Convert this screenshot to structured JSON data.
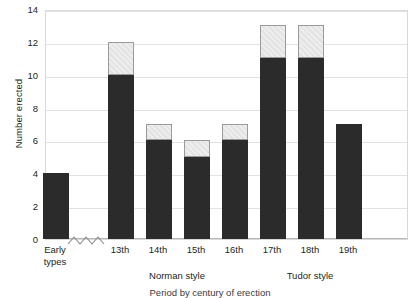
{
  "chart_data": {
    "type": "bar",
    "subtype": "stacked-bar",
    "title": "",
    "xlabel": "Period by century of erection",
    "ylabel": "Number erected",
    "ylim": [
      0,
      14
    ],
    "ytick_values": [
      0,
      2,
      4,
      6,
      8,
      10,
      12,
      14
    ],
    "ytick_labels": [
      "0",
      "2",
      "4",
      "6",
      "8",
      "10",
      "12",
      "14"
    ],
    "grid": true,
    "legend": "none",
    "axis_break": {
      "present": true,
      "symbol": "zigzag",
      "between": [
        "Early types",
        "13th"
      ]
    },
    "categories": [
      "Early types",
      "13th",
      "14th",
      "15th",
      "16th",
      "17th",
      "18th",
      "19th"
    ],
    "series": [
      {
        "name": "dark",
        "color": "#2b2b2b",
        "values": [
          4,
          10,
          6,
          5,
          6,
          11,
          11,
          7
        ]
      },
      {
        "name": "light",
        "color": "#ededed",
        "values": [
          0,
          2,
          1,
          1,
          1,
          2,
          2,
          0
        ]
      }
    ],
    "totals": [
      4,
      12,
      7,
      6,
      7,
      13,
      13,
      7
    ],
    "group_labels": [
      {
        "label": "Norman style",
        "categories": [
          "13th",
          "14th",
          "15th",
          "16th"
        ]
      },
      {
        "label": "Tudor style",
        "categories": [
          "17th",
          "18th",
          "19th"
        ]
      }
    ]
  },
  "colors": {
    "dark": "#2b2b2b",
    "light": "#ededed",
    "light_border": "#9a9a9a",
    "grid": "#e2e2e2",
    "frame": "#d9d9d9",
    "text": "#231f20"
  }
}
